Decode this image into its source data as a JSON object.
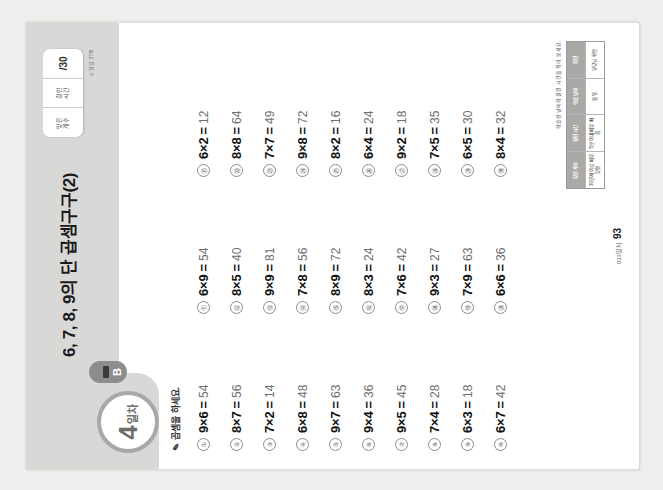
{
  "worksheet": {
    "title": "6, 7, 8, 9의 단 곱셈구구(2)",
    "day_number": "4",
    "day_unit": "일차",
    "section_badge": "B",
    "instruction": "곱셈을 하세요.",
    "pencil_icon": "pencil-icon"
  },
  "score_box": {
    "columns": [
      {
        "label": "맞은",
        "value": "개수"
      },
      {
        "label": "걸린",
        "value": "시간"
      }
    ],
    "total": "/30",
    "note": "※ 정답 37쪽"
  },
  "problems": [
    {
      "no": "①",
      "a": "9",
      "b": "6",
      "answer": "54"
    },
    {
      "no": "②",
      "a": "8",
      "b": "7",
      "answer": "56"
    },
    {
      "no": "③",
      "a": "7",
      "b": "2",
      "answer": "14"
    },
    {
      "no": "④",
      "a": "6",
      "b": "8",
      "answer": "48"
    },
    {
      "no": "⑤",
      "a": "9",
      "b": "7",
      "answer": "63"
    },
    {
      "no": "⑥",
      "a": "9",
      "b": "4",
      "answer": "36"
    },
    {
      "no": "⑦",
      "a": "9",
      "b": "5",
      "answer": "45"
    },
    {
      "no": "⑧",
      "a": "7",
      "b": "4",
      "answer": "28"
    },
    {
      "no": "⑨",
      "a": "6",
      "b": "3",
      "answer": "18"
    },
    {
      "no": "⑩",
      "a": "6",
      "b": "7",
      "answer": "42"
    },
    {
      "no": "⑪",
      "a": "6",
      "b": "9",
      "answer": "54"
    },
    {
      "no": "⑫",
      "a": "8",
      "b": "5",
      "answer": "40"
    },
    {
      "no": "⑬",
      "a": "9",
      "b": "9",
      "answer": "81"
    },
    {
      "no": "⑭",
      "a": "7",
      "b": "8",
      "answer": "56"
    },
    {
      "no": "⑮",
      "a": "8",
      "b": "9",
      "answer": "72"
    },
    {
      "no": "⑯",
      "a": "8",
      "b": "3",
      "answer": "24"
    },
    {
      "no": "⑰",
      "a": "7",
      "b": "6",
      "answer": "42"
    },
    {
      "no": "⑱",
      "a": "9",
      "b": "3",
      "answer": "27"
    },
    {
      "no": "⑲",
      "a": "7",
      "b": "9",
      "answer": "63"
    },
    {
      "no": "⑳",
      "a": "6",
      "b": "6",
      "answer": "36"
    },
    {
      "no": "㉑",
      "a": "6",
      "b": "2",
      "answer": "12"
    },
    {
      "no": "㉒",
      "a": "8",
      "b": "8",
      "answer": "64"
    },
    {
      "no": "㉓",
      "a": "7",
      "b": "7",
      "answer": "49"
    },
    {
      "no": "㉔",
      "a": "9",
      "b": "8",
      "answer": "72"
    },
    {
      "no": "㉕",
      "a": "8",
      "b": "2",
      "answer": "16"
    },
    {
      "no": "㉖",
      "a": "6",
      "b": "4",
      "answer": "24"
    },
    {
      "no": "㉗",
      "a": "9",
      "b": "2",
      "answer": "18"
    },
    {
      "no": "㉘",
      "a": "7",
      "b": "5",
      "answer": "35"
    },
    {
      "no": "㉙",
      "a": "6",
      "b": "5",
      "answer": "30"
    },
    {
      "no": "㉚",
      "a": "8",
      "b": "4",
      "answer": "32"
    }
  ],
  "footer": {
    "text": "033일차",
    "page": "93"
  },
  "rubric": {
    "caption": "학습한 날짜와 걸린 시간을 적어 보세요.",
    "header": [
      "맞은 개수",
      "걸린 시간",
      "학습 날짜",
      "확인"
    ],
    "body": [
      "30문제 이상 매우 잘함",
      "5분 이내 매우 빠름",
      "월       일",
      "부모님 확인"
    ]
  },
  "colors": {
    "band": "#d8d8d6",
    "badge": "#8d8d8b",
    "page_bg": "#ffffff"
  }
}
